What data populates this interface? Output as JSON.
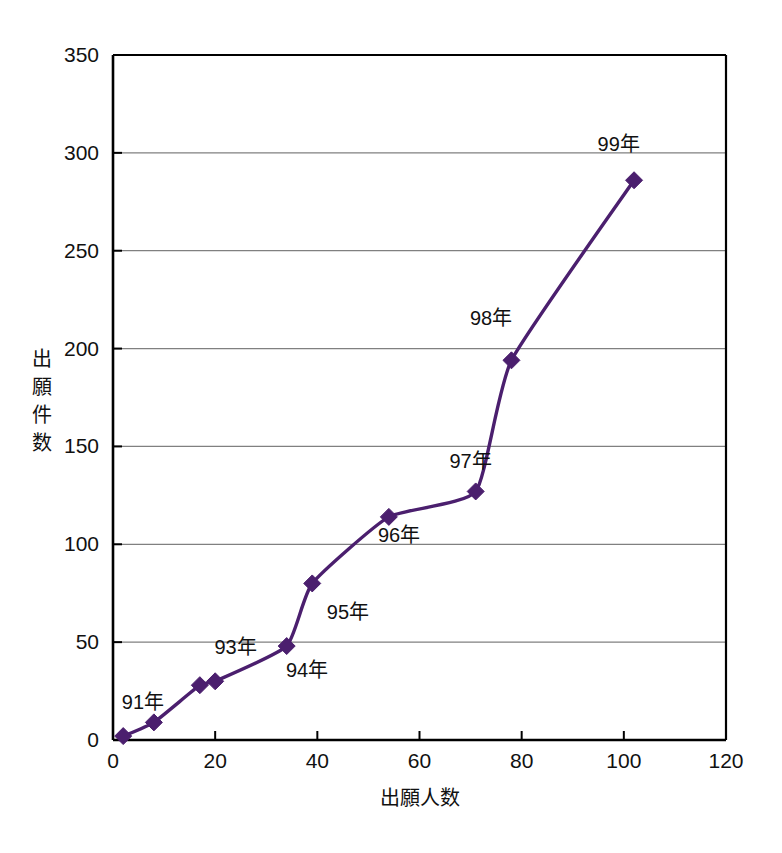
{
  "chart_data": {
    "type": "line",
    "title": "",
    "xlabel": "出願人数",
    "ylabel": "出願件数",
    "xlim": [
      0,
      120
    ],
    "ylim": [
      0,
      350
    ],
    "xticks": [
      "0",
      "20",
      "40",
      "60",
      "80",
      "100",
      "120"
    ],
    "xtick_values": [
      0,
      20,
      40,
      60,
      80,
      100,
      120
    ],
    "yticks": [
      "0",
      "50",
      "100",
      "150",
      "200",
      "250",
      "300",
      "350"
    ],
    "ytick_values": [
      0,
      50,
      100,
      150,
      200,
      250,
      300,
      350
    ],
    "grid": "horizontal",
    "legend": "none",
    "series": [
      {
        "name": "出願人数 vs 出願件数",
        "color": "#4B1F6E",
        "marker": "diamond",
        "points": [
          {
            "label": "",
            "x": 2,
            "y": 2
          },
          {
            "label": "91年",
            "x": 8,
            "y": 9
          },
          {
            "label": "",
            "x": 17,
            "y": 28
          },
          {
            "label": "93年",
            "x": 20,
            "y": 30
          },
          {
            "label": "94年",
            "x": 34,
            "y": 48
          },
          {
            "label": "95年",
            "x": 39,
            "y": 80
          },
          {
            "label": "96年",
            "x": 54,
            "y": 114
          },
          {
            "label": "97年",
            "x": 71,
            "y": 127
          },
          {
            "label": "98年",
            "x": 78,
            "y": 194
          },
          {
            "label": "99年",
            "x": 102,
            "y": 286
          }
        ]
      }
    ],
    "annotations": [
      {
        "text": "91年",
        "x": 10,
        "y": 16,
        "anchor": "end"
      },
      {
        "text": "93年",
        "x": 24,
        "y": 44,
        "anchor": "middle"
      },
      {
        "text": "94年",
        "x": 38,
        "y": 32,
        "anchor": "middle"
      },
      {
        "text": "95年",
        "x": 46,
        "y": 62,
        "anchor": "middle"
      },
      {
        "text": "96年",
        "x": 56,
        "y": 101,
        "anchor": "middle"
      },
      {
        "text": "97年",
        "x": 70,
        "y": 139,
        "anchor": "middle"
      },
      {
        "text": "98年",
        "x": 74,
        "y": 212,
        "anchor": "middle"
      },
      {
        "text": "99年",
        "x": 99,
        "y": 301,
        "anchor": "middle"
      }
    ],
    "ylabel_chars": [
      "出",
      "願",
      "件",
      "数"
    ],
    "colors": {
      "line": "#4B1F6E",
      "marker": "#4B1F6E",
      "axis": "#000000",
      "grid": "#808080",
      "background": "#ffffff"
    }
  }
}
